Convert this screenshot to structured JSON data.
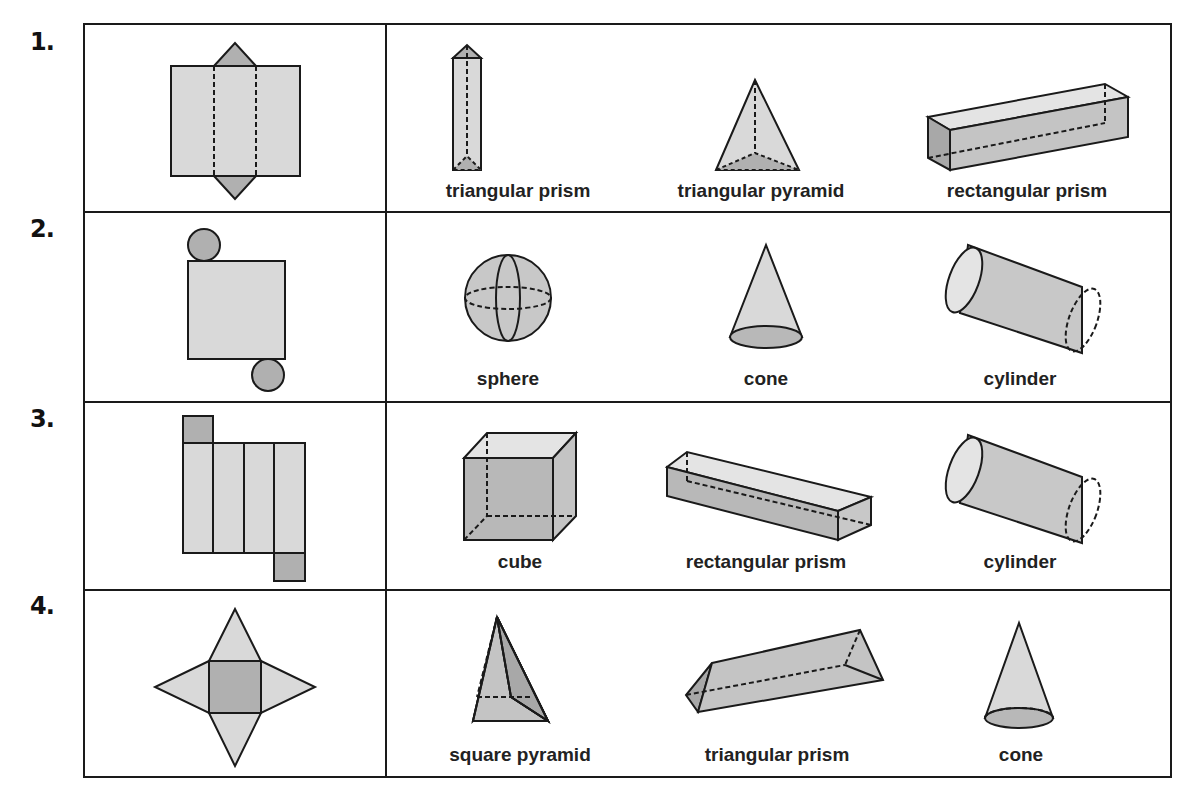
{
  "rows": [
    {
      "number": "1.",
      "net": "triangular-prism-net",
      "choices": [
        "triangular prism",
        "triangular pyramid",
        "rectangular prism"
      ]
    },
    {
      "number": "2.",
      "net": "cylinder-net",
      "choices": [
        "sphere",
        "cone",
        "cylinder"
      ]
    },
    {
      "number": "3.",
      "net": "rectangular-prism-net",
      "choices": [
        "cube",
        "rectangular prism",
        "cylinder"
      ]
    },
    {
      "number": "4.",
      "net": "square-pyramid-net",
      "choices": [
        "square pyramid",
        "triangular prism",
        "cone"
      ]
    }
  ],
  "colors": {
    "light_fill": "#d9d9d9",
    "dark_fill": "#b0b0b0",
    "stroke": "#1a1a1a"
  }
}
